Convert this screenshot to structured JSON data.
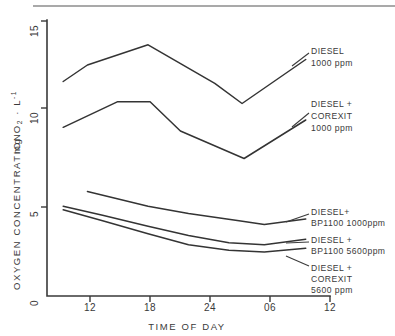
{
  "chart_data": {
    "type": "line",
    "title": "",
    "xlabel": "TIME OF DAY",
    "ylabel": "OXYGEN CONCENTRATION  mg O2 . L-1",
    "ylabel_parts": {
      "main": "OXYGEN CONCENTRATION",
      "unit_prefix": "mg O",
      "unit_sub": "2",
      "unit_mid": " · L",
      "unit_sup": "-1"
    },
    "x_tick_labels": [
      "12",
      "18",
      "24",
      "06",
      "12"
    ],
    "x_tick_values": [
      12,
      18,
      24,
      30,
      36
    ],
    "xlim": [
      8,
      36
    ],
    "y_tick_labels": [
      "0",
      "5",
      "10",
      "15"
    ],
    "y_tick_values": [
      0,
      5,
      10,
      15
    ],
    "ylim": [
      0,
      15
    ],
    "grid": false,
    "legend_position": "right-inline-leader-labels",
    "series": [
      {
        "name": "DIESEL 1000 ppm",
        "label_lines": [
          "DIESEL",
          "1000 ppm"
        ],
        "x": [
          9.6,
          12.0,
          18.0,
          24.6,
          27.3,
          33.6
        ],
        "values": [
          11.7,
          12.6,
          13.7,
          11.6,
          10.5,
          12.9
        ]
      },
      {
        "name": "DIESEL + COREXIT 1000 ppm",
        "label_lines": [
          "DIESEL +",
          "COREXIT",
          "1000 ppm"
        ],
        "x": [
          9.6,
          15.0,
          18.2,
          21.2,
          27.5,
          33.6
        ],
        "values": [
          9.2,
          10.6,
          10.6,
          9.0,
          7.5,
          9.6
        ]
      },
      {
        "name": "DIESEL + BP1100 1000ppm",
        "label_lines": [
          "DIESEL+",
          "BP1100  1000ppm"
        ],
        "x": [
          12.0,
          18.0,
          22.0,
          27.0,
          29.5,
          33.6
        ],
        "values": [
          5.7,
          4.9,
          4.5,
          4.1,
          3.9,
          4.2
        ]
      },
      {
        "name": "DIESEL + BP1100 5600ppm",
        "label_lines": [
          "DIESEL +",
          "BP1100  5600ppm"
        ],
        "x": [
          9.6,
          13.5,
          18.0,
          22.0,
          26.0,
          29.5,
          33.6
        ],
        "values": [
          4.9,
          4.4,
          3.8,
          3.3,
          2.9,
          2.8,
          3.1
        ]
      },
      {
        "name": "DIESEL + COREXIT 5600 ppm",
        "label_lines": [
          "DIESEL +",
          "COREXIT",
          "5600 ppm"
        ],
        "x": [
          9.6,
          13.5,
          18.0,
          22.0,
          26.0,
          29.5,
          33.6
        ],
        "values": [
          4.7,
          4.1,
          3.4,
          2.8,
          2.5,
          2.4,
          2.6
        ]
      }
    ]
  },
  "legend_blocks": [
    {
      "id": "diesel-1000",
      "lines": [
        "DIESEL",
        "1000 ppm"
      ]
    },
    {
      "id": "diesel-corexit-1000",
      "lines": [
        "DIESEL +",
        "COREXIT",
        "1000 ppm"
      ]
    },
    {
      "id": "diesel-bp1100-1000",
      "lines": [
        "DIESEL+",
        "BP1100  1000ppm"
      ]
    },
    {
      "id": "diesel-bp1100-5600",
      "lines": [
        "DIESEL +",
        "BP1100  5600ppm"
      ]
    },
    {
      "id": "diesel-corexit-5600",
      "lines": [
        "DIESEL +",
        "COREXIT",
        "5600 ppm"
      ]
    }
  ]
}
